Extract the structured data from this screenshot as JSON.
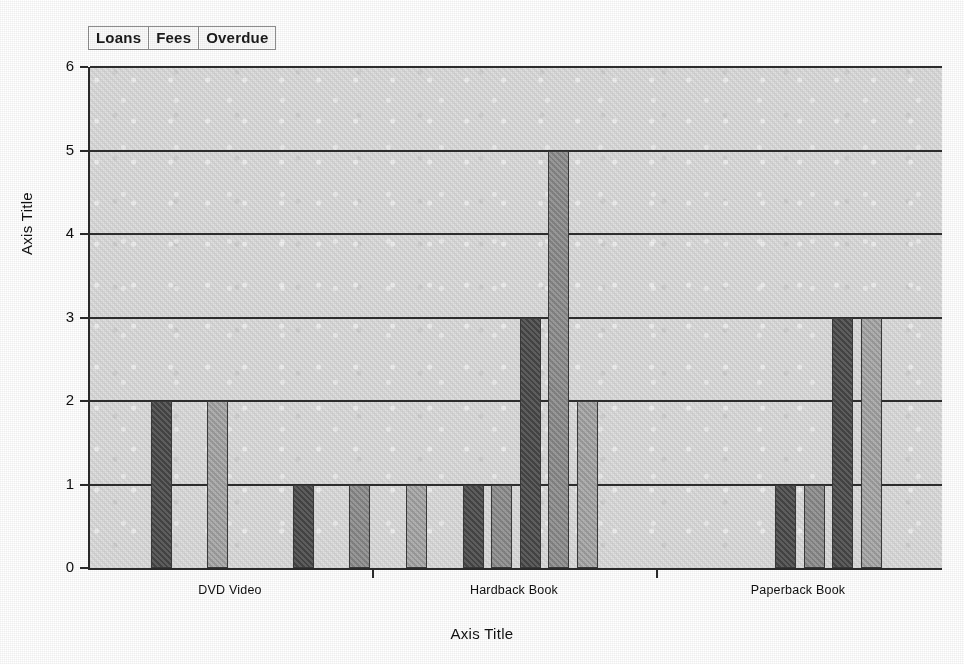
{
  "legend": {
    "items": [
      {
        "label": "Loans",
        "color": "#4a4a4a"
      },
      {
        "label": "Fees",
        "color": "#8e8e8e"
      },
      {
        "label": "Overdue",
        "color": "#a8a8a8"
      }
    ]
  },
  "axes": {
    "y_title": "Axis Title",
    "x_title": "Axis Title",
    "y_ticks": [
      "0",
      "1",
      "2",
      "3",
      "4",
      "5",
      "6"
    ]
  },
  "chart_data": {
    "type": "bar",
    "title": "",
    "xlabel": "Axis Title",
    "ylabel": "Axis Title",
    "ylim": [
      0,
      6
    ],
    "yticks": [
      0,
      1,
      2,
      3,
      4,
      5,
      6
    ],
    "grid": true,
    "legend_position": "top-left",
    "categories": [
      "DVD Video",
      "Hardback Book",
      "Paperback Book"
    ],
    "series": [
      {
        "name": "Loans",
        "color": "#4a4a4a"
      },
      {
        "name": "Fees",
        "color": "#8e8e8e"
      },
      {
        "name": "Overdue",
        "color": "#a8a8a8"
      }
    ],
    "bars": [
      {
        "series": 0,
        "group": 0,
        "slot": 2,
        "value": 2
      },
      {
        "series": 2,
        "group": 0,
        "slot": 4,
        "value": 2
      },
      {
        "series": 0,
        "group": 0,
        "slot": 7,
        "value": 1
      },
      {
        "series": 1,
        "group": 0,
        "slot": 9,
        "value": 1
      },
      {
        "series": 2,
        "group": 0,
        "slot": 11,
        "value": 1
      },
      {
        "series": 0,
        "group": 1,
        "slot": 13,
        "value": 1
      },
      {
        "series": 1,
        "group": 1,
        "slot": 14,
        "value": 1
      },
      {
        "series": 0,
        "group": 1,
        "slot": 15,
        "value": 3
      },
      {
        "series": 1,
        "group": 1,
        "slot": 16,
        "value": 5
      },
      {
        "series": 2,
        "group": 1,
        "slot": 17,
        "value": 2
      },
      {
        "series": 0,
        "group": 2,
        "slot": 24,
        "value": 1
      },
      {
        "series": 1,
        "group": 2,
        "slot": 25,
        "value": 1
      },
      {
        "series": 0,
        "group": 2,
        "slot": 26,
        "value": 3
      },
      {
        "series": 2,
        "group": 2,
        "slot": 27,
        "value": 3
      }
    ]
  }
}
